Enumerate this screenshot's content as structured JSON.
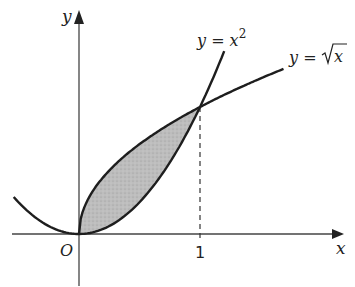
{
  "diagram": {
    "axes": {
      "x_label": "x",
      "y_label": "y",
      "origin_label": "O",
      "x_tick_label": "1"
    },
    "curves": [
      {
        "name": "parabola",
        "label_prefix": "y = x",
        "label_sup": "2",
        "color": "#1e1e1e"
      },
      {
        "name": "sqrt",
        "label_prefix": "y = ",
        "label_radicand": "x",
        "color": "#1e1e1e"
      }
    ],
    "intersection": {
      "x": 1,
      "y": 1
    },
    "shaded_region": {
      "from_x": 0,
      "to_x": 1,
      "fill": "#b8b8b8"
    },
    "colors": {
      "axis": "#333333",
      "curve": "#1e1e1e",
      "shade": "#b8b8b8",
      "dashed": "#333333"
    }
  },
  "chart_data": {
    "type": "line",
    "title": "",
    "xlabel": "x",
    "ylabel": "y",
    "series": [
      {
        "name": "y = x^2",
        "x": [
          -0.54,
          -0.25,
          0,
          0.25,
          0.5,
          0.75,
          1,
          1.17
        ],
        "values": [
          0.29,
          0.0625,
          0,
          0.0625,
          0.25,
          0.5625,
          1,
          1.37
        ]
      },
      {
        "name": "y = sqrt(x)",
        "x": [
          0,
          0.25,
          0.5,
          0.75,
          1,
          1.25,
          1.5,
          1.69
        ],
        "values": [
          0,
          0.5,
          0.707,
          0.866,
          1,
          1.118,
          1.225,
          1.3
        ]
      }
    ],
    "annotations": [
      "O",
      "1",
      "shaded region between curves for 0 ≤ x ≤ 1",
      "dashed vertical line at x = 1"
    ],
    "xlim": [
      -0.55,
      2.2
    ],
    "ylim": [
      -0.4,
      1.75
    ],
    "grid": false
  }
}
